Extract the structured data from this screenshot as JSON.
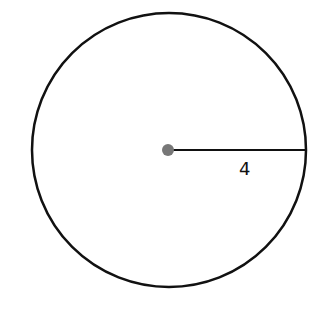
{
  "diagram": {
    "type": "circle-with-radius",
    "circle": {
      "cx": 169,
      "cy": 150,
      "r": 137,
      "stroke": "#111111",
      "stroke_width": 2.5
    },
    "center_point": {
      "cx": 168,
      "cy": 150,
      "r": 6,
      "fill": "#777777"
    },
    "radius_segment": {
      "x1": 168,
      "y1": 150,
      "x2": 306,
      "y2": 150
    },
    "radius_label": "4"
  }
}
